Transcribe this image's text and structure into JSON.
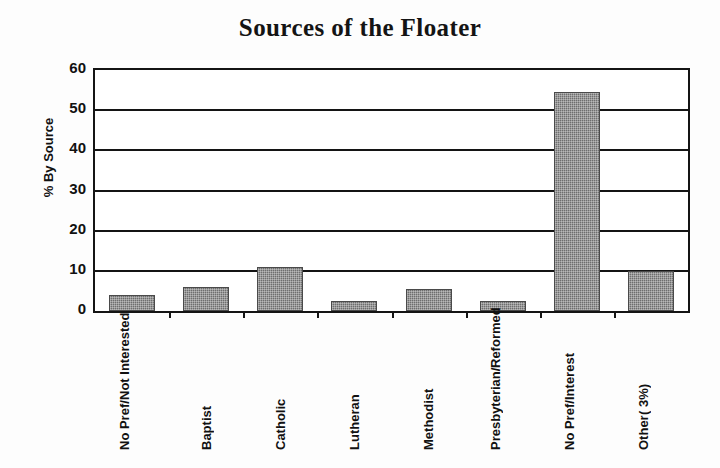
{
  "chart_data": {
    "type": "bar",
    "title": "Sources of the Floater",
    "xlabel": "",
    "ylabel": "% By Source",
    "ylim": [
      0,
      60
    ],
    "ytick_step": 10,
    "yticks": [
      60,
      50,
      40,
      30,
      20,
      10,
      0
    ],
    "grid": true,
    "legend": false,
    "bar_color": "#6e6e6e",
    "categories": [
      "No Pref/ Not Interested",
      "Baptist",
      "Catholic",
      "Lutheran",
      "Methodist",
      "Presbyterian/ Reformed",
      "No Pref/ Interest",
      "Other ( 3%)"
    ],
    "category_lines": [
      [
        "No Pref/",
        "Not Interested"
      ],
      [
        "Baptist"
      ],
      [
        "Catholic"
      ],
      [
        "Lutheran"
      ],
      [
        "Methodist"
      ],
      [
        "Presbyterian/",
        "Reformed"
      ],
      [
        "No Pref/",
        "Interest"
      ],
      [
        "Other",
        "( 3%)"
      ]
    ],
    "values": [
      4,
      6,
      11,
      2.5,
      5.5,
      2.5,
      54.5,
      10
    ]
  },
  "axis": {
    "y_tick_labels": [
      "60",
      "50",
      "40",
      "30",
      "20",
      "10",
      "0"
    ]
  }
}
